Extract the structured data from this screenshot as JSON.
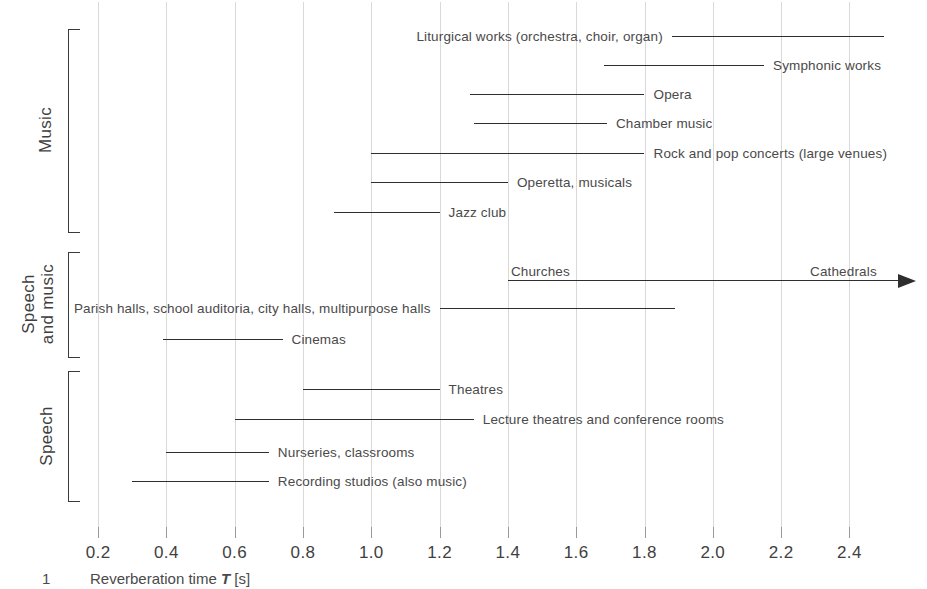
{
  "chart_data": {
    "type": "bar",
    "orientation": "horizontal-range",
    "title": "",
    "xlabel": "Reverberation time T [s]",
    "ylabel": "",
    "xlim": [
      0.1,
      2.55
    ],
    "grid": true,
    "legend": "none",
    "xticks": [
      0.2,
      0.4,
      0.6,
      0.8,
      1.0,
      1.2,
      1.4,
      1.6,
      1.8,
      2.0,
      2.2,
      2.4
    ],
    "xtick_labels": [
      "0.2",
      "0.4",
      "0.6",
      "0.8",
      "1.0",
      "1.2",
      "1.4",
      "1.6",
      "1.8",
      "2.0",
      "2.2",
      "2.4"
    ],
    "groups": [
      {
        "name": "Music",
        "label": "Music",
        "rows": [
          {
            "label": "Liturgical works (orchestra, choir, organ)",
            "start": 1.88,
            "end": 2.5,
            "label_side": "left",
            "open_ended": false
          },
          {
            "label": "Symphonic works",
            "start": 1.68,
            "end": 2.15,
            "label_side": "right",
            "open_ended": false
          },
          {
            "label": "Opera",
            "start": 1.29,
            "end": 1.8,
            "label_side": "right",
            "open_ended": false
          },
          {
            "label": "Chamber music",
            "start": 1.3,
            "end": 1.69,
            "label_side": "right",
            "open_ended": false
          },
          {
            "label": "Rock and pop concerts (large venues)",
            "start": 1.0,
            "end": 1.8,
            "label_side": "right",
            "open_ended": false
          },
          {
            "label": "Operetta, musicals",
            "start": 1.0,
            "end": 1.4,
            "label_side": "right",
            "open_ended": false
          },
          {
            "label": "Jazz club",
            "start": 0.89,
            "end": 1.2,
            "label_side": "right",
            "open_ended": false
          }
        ]
      },
      {
        "name": "Speech and music",
        "label": "Speech\nand music",
        "label_line1": "Speech",
        "label_line2": "and music",
        "rows": [
          {
            "label": "Churches",
            "label2": "Cathedrals",
            "start": 1.4,
            "end": 2.6,
            "label_side": "above",
            "open_ended": true
          },
          {
            "label": "Parish halls, school auditoria, city halls, multipurpose halls",
            "start": 1.2,
            "end": 1.89,
            "label_side": "left",
            "open_ended": false
          },
          {
            "label": "Cinemas",
            "start": 0.39,
            "end": 0.74,
            "label_side": "right",
            "open_ended": false
          }
        ]
      },
      {
        "name": "Speech",
        "label": "Speech",
        "rows": [
          {
            "label": "Theatres",
            "start": 0.8,
            "end": 1.2,
            "label_side": "right",
            "open_ended": false
          },
          {
            "label": "Lecture theatres and conference rooms",
            "start": 0.6,
            "end": 1.3,
            "label_side": "right",
            "open_ended": false
          },
          {
            "label": "Nurseries, classrooms",
            "start": 0.4,
            "end": 0.7,
            "label_side": "right",
            "open_ended": false
          },
          {
            "label": "Recording studios (also music)",
            "start": 0.3,
            "end": 0.7,
            "label_side": "right",
            "open_ended": false
          }
        ]
      }
    ]
  },
  "caption": {
    "number": "1",
    "text_before": "Reverberation time ",
    "symbol": "T",
    "text_after": " [s]"
  },
  "colors": {
    "line": "#2e2e2e",
    "grid": "#d9d9d9",
    "text": "#4a4a4a",
    "bracket": "#3a3a3a"
  }
}
